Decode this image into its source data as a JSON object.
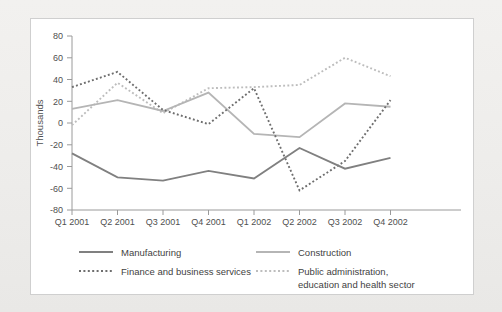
{
  "chart_data": {
    "type": "line",
    "title": "",
    "subtitle": "",
    "xlabel": "",
    "ylabel": "Thousands",
    "categories": [
      "Q1 2001",
      "Q2 2001",
      "Q3 2001",
      "Q4 2001",
      "Q1 2002",
      "Q2 2002",
      "Q3 2002",
      "Q4 2002"
    ],
    "ylim": [
      -80,
      80
    ],
    "yticks": [
      80,
      60,
      40,
      20,
      0,
      -20,
      -40,
      -60,
      -80
    ],
    "ytick_labels": [
      "80",
      "60",
      "40",
      "20",
      "0",
      "-20",
      "-40",
      "-60",
      "-80"
    ],
    "grid": false,
    "legend_position": "bottom",
    "series": [
      {
        "name": "Manufacturing",
        "style": "solid",
        "color": "#808080",
        "values": [
          -28,
          -50,
          -53,
          -44,
          -51,
          -23,
          -42,
          -32
        ]
      },
      {
        "name": "Construction",
        "style": "solid",
        "color": "#b5b5b5",
        "values": [
          13,
          21,
          11,
          28,
          -10,
          -13,
          18,
          15
        ]
      },
      {
        "name": "Finance and business services",
        "style": "dotted",
        "color": "#6e6e6e",
        "values": [
          33,
          47,
          12,
          -1,
          32,
          -62,
          -35,
          21
        ]
      },
      {
        "name": "Public administration, education and health sector",
        "style": "dotted",
        "color": "#bdbdbd",
        "values": [
          -2,
          37,
          9,
          32,
          33,
          35,
          60,
          43
        ]
      }
    ]
  },
  "legend": {
    "entries": [
      {
        "label": "Manufacturing",
        "style": "solid",
        "color": "#808080"
      },
      {
        "label": "Construction",
        "style": "solid",
        "color": "#b5b5b5"
      },
      {
        "label": "Finance and business services",
        "style": "dotted",
        "color": "#6e6e6e"
      },
      {
        "label": "Public administration,",
        "label2": "education and health sector",
        "style": "dotted",
        "color": "#bdbdbd"
      }
    ]
  },
  "axis": {
    "y_title": "Thousands"
  }
}
